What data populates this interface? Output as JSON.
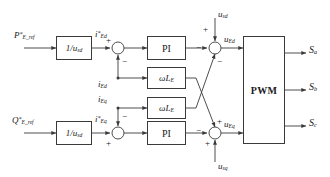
{
  "diagram": {
    "type": "control-block-diagram"
  },
  "inputs": {
    "p_ref": "P*E_ref",
    "q_ref": "Q*E_ref",
    "u_sd_top": "usd",
    "u_sq_bottom": "usq"
  },
  "blocks": {
    "gain_d": "1/usd",
    "gain_q": "1/usd",
    "pi_d": "PI",
    "pi_q": "PI",
    "coupling_d": "ωLE",
    "coupling_q": "ωLE",
    "pwm": "PWM"
  },
  "signals": {
    "i_d_ref": "i*Ed",
    "i_q_ref": "i*Eq",
    "i_d_fb": "iEd",
    "i_q_fb": "iEq",
    "u_ed": "uEd",
    "u_eq": "uEq"
  },
  "outputs": {
    "s_a": "Sa",
    "s_b": "Sb",
    "s_c": "Sc"
  },
  "signs": {
    "sum_d_plus": "+",
    "sum_d_minus": "−",
    "sum_q_minus": "−",
    "sum_q_plus": "+",
    "out_d_plus": "+",
    "out_d_minus_left": "−",
    "out_d_minus_bottom": "−",
    "out_q_minus_left": "−",
    "out_q_plus_top": "+",
    "out_q_plus_bottom": "+"
  },
  "colors": {
    "line": "#3a3a3a",
    "text": "#1a1a1a",
    "background": "#ffffff"
  }
}
